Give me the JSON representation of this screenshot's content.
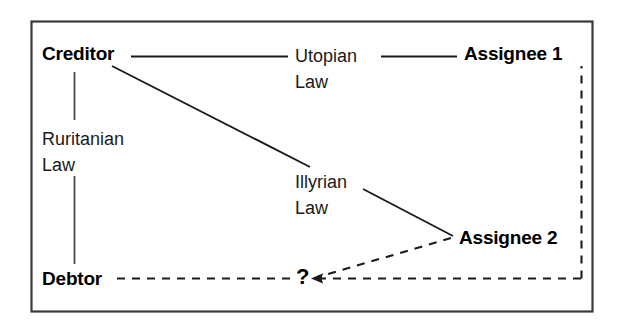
{
  "figure": {
    "background_color": "#ffffff",
    "border_color": "#3a3a3a",
    "line_color": "#1a1a1a",
    "frame": {
      "x": 31,
      "y": 21,
      "width": 562,
      "height": 291
    }
  },
  "nodes": [
    {
      "id": "creditor",
      "label": "Creditor",
      "x": 42,
      "y": 44
    },
    {
      "id": "assignee1",
      "label": "Assignee 1",
      "x": 464,
      "y": 44
    },
    {
      "id": "assignee2",
      "label": "Assignee 2",
      "x": 459,
      "y": 228
    },
    {
      "id": "debtor",
      "label": "Debtor",
      "x": 42,
      "y": 269
    }
  ],
  "unknown_marker": {
    "label": "?",
    "x": 296,
    "y": 266
  },
  "edge_labels": [
    {
      "id": "utopian",
      "line1": "Utopian",
      "line2": "Law",
      "x": 295,
      "y": 44
    },
    {
      "id": "ruritanian",
      "line1": "Ruritanian",
      "line2": "Law",
      "x": 42,
      "y": 127
    },
    {
      "id": "illyrian",
      "line1": "Illyrian",
      "line2": "Law",
      "x": 295,
      "y": 170
    }
  ],
  "edges": [
    {
      "id": "creditor-utopian",
      "style": "solid",
      "from": "creditor",
      "to": "utopian-label"
    },
    {
      "id": "utopian-assignee1",
      "style": "solid",
      "from": "utopian-label",
      "to": "assignee1"
    },
    {
      "id": "creditor-debtor",
      "style": "solid",
      "from": "creditor",
      "to": "debtor"
    },
    {
      "id": "creditor-illyrian",
      "style": "solid",
      "from": "creditor",
      "to": "illyrian-label"
    },
    {
      "id": "illyrian-assignee2",
      "style": "solid",
      "from": "illyrian-label",
      "to": "assignee2"
    },
    {
      "id": "debtor-question",
      "style": "dashed",
      "from": "debtor",
      "to": "unknown-marker"
    },
    {
      "id": "assignee2-question",
      "style": "dashed",
      "from": "assignee2",
      "to": "unknown-marker",
      "arrow": true
    },
    {
      "id": "assignee1-question",
      "style": "dashed",
      "from": "assignee1",
      "to": "unknown-marker",
      "arrow": true
    }
  ]
}
